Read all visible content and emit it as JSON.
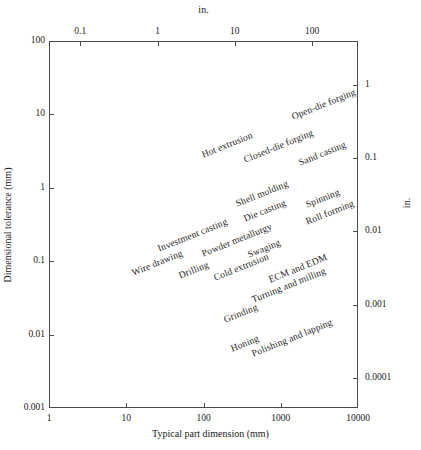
{
  "chart_data": {
    "type": "scatter",
    "title": "",
    "xlabel": "Typical part dimension (mm)",
    "ylabel": "Dimensional tolerance (mm)",
    "top_axis_label": "in.",
    "right_axis_label": "in.",
    "xscale": "log",
    "yscale": "log",
    "xlim": [
      1,
      10000
    ],
    "ylim": [
      0.001,
      100
    ],
    "grid": false,
    "legend": false,
    "x_ticks": [
      "1",
      "10",
      "100",
      "1000",
      "10000"
    ],
    "y_ticks": [
      "100",
      "10",
      "1",
      "0.1",
      "0.01",
      "0.001"
    ],
    "top_ticks": [
      "0.1",
      "1",
      "10",
      "100"
    ],
    "right_ticks": [
      "1",
      "0.1",
      "0.01",
      "0.001",
      "0.0001"
    ],
    "points": [
      {
        "label": "Open-die forging",
        "x": 1400,
        "y": 11.0
      },
      {
        "label": "Hot extrusion",
        "x": 95,
        "y": 3.4
      },
      {
        "label": "Closed-die forging",
        "x": 330,
        "y": 2.9
      },
      {
        "label": "Sand casting",
        "x": 1700,
        "y": 2.6
      },
      {
        "label": "Shell molding",
        "x": 260,
        "y": 0.72
      },
      {
        "label": "Spinning",
        "x": 2100,
        "y": 0.7
      },
      {
        "label": "Die casting",
        "x": 330,
        "y": 0.46
      },
      {
        "label": "Roll forming",
        "x": 2100,
        "y": 0.42
      },
      {
        "label": "Investment casting",
        "x": 26,
        "y": 0.18
      },
      {
        "label": "Powder metallurgy",
        "x": 95,
        "y": 0.15
      },
      {
        "label": "Swaging",
        "x": 380,
        "y": 0.145
      },
      {
        "label": "Wire drawing",
        "x": 12,
        "y": 0.083
      },
      {
        "label": "Drilling",
        "x": 48,
        "y": 0.077
      },
      {
        "label": "Cold extrusion",
        "x": 135,
        "y": 0.072
      },
      {
        "label": "ECM and EDM",
        "x": 700,
        "y": 0.068
      },
      {
        "label": "Turning and milling",
        "x": 420,
        "y": 0.036
      },
      {
        "label": "Grinding",
        "x": 185,
        "y": 0.019
      },
      {
        "label": "Honing",
        "x": 230,
        "y": 0.0078
      },
      {
        "label": "Polishing and lapping",
        "x": 430,
        "y": 0.0065
      }
    ]
  },
  "axes": {
    "left": {
      "title": "Dimensional tolerance (mm)",
      "ticks": [
        {
          "label": "100",
          "value": 100
        },
        {
          "label": "10",
          "value": 10
        },
        {
          "label": "1",
          "value": 1
        },
        {
          "label": "0.1",
          "value": 0.1
        },
        {
          "label": "0.01",
          "value": 0.01
        },
        {
          "label": "0.001",
          "value": 0.001
        }
      ]
    },
    "right": {
      "title": "in.",
      "ticks": [
        {
          "label": "1",
          "value": 25.4
        },
        {
          "label": "0.1",
          "value": 2.54
        },
        {
          "label": "0.01",
          "value": 0.254
        },
        {
          "label": "0.001",
          "value": 0.0254
        },
        {
          "label": "0.0001",
          "value": 0.00254
        }
      ]
    },
    "bottom": {
      "title": "Typical part dimension (mm)",
      "ticks": [
        {
          "label": "1",
          "value": 1
        },
        {
          "label": "10",
          "value": 10
        },
        {
          "label": "100",
          "value": 100
        },
        {
          "label": "1000",
          "value": 1000
        },
        {
          "label": "10000",
          "value": 10000
        }
      ]
    },
    "top": {
      "title": "in.",
      "ticks": [
        {
          "label": "0.1",
          "value": 2.54
        },
        {
          "label": "1",
          "value": 25.4
        },
        {
          "label": "10",
          "value": 254
        },
        {
          "label": "100",
          "value": 2540
        }
      ]
    }
  },
  "style": {
    "frame_color": "#4a4a4a",
    "text_color": "#1a1a1a",
    "label_color": "#262626",
    "background": "#ffffff",
    "label_rotation_deg": -22
  }
}
